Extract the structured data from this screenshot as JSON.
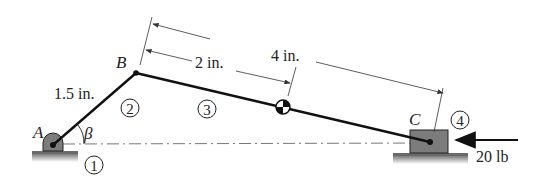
{
  "diagram": {
    "type": "slider-crank mechanism",
    "points": {
      "A": {
        "label": "A"
      },
      "B": {
        "label": "B"
      },
      "C": {
        "label": "C"
      }
    },
    "angle": {
      "label": "β"
    },
    "links": [
      {
        "id": "1",
        "label": "1",
        "name": "ground"
      },
      {
        "id": "2",
        "label": "2",
        "name": "crank AB"
      },
      {
        "id": "3",
        "label": "3",
        "name": "connecting rod BC"
      },
      {
        "id": "4",
        "label": "4",
        "name": "slider"
      }
    ],
    "dimensions": {
      "ab_length": "1.5 in.",
      "b_to_com": "2 in.",
      "b_to_c": "4 in."
    },
    "force": {
      "label": "20 lb",
      "direction": "left"
    },
    "colors": {
      "link": "#111111",
      "support": "#6e6e6e",
      "ground": "#8a8a8a",
      "dim_line": "#333333"
    }
  }
}
